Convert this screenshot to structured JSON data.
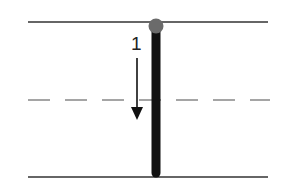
{
  "diagram": {
    "type": "stroke-order-guide",
    "guidelines": {
      "top": {
        "y": 22,
        "style": "solid"
      },
      "middle": {
        "y": 100,
        "style": "dashed"
      },
      "bottom": {
        "y": 177,
        "style": "solid"
      }
    },
    "strokes": [
      {
        "number": "1",
        "direction": "down",
        "start": "top",
        "end": "bottom"
      }
    ],
    "colors": {
      "stroke": "#111111",
      "start_dot": "#6b6b6b",
      "guide_line": "#333333",
      "dashed_line": "#888888"
    }
  }
}
